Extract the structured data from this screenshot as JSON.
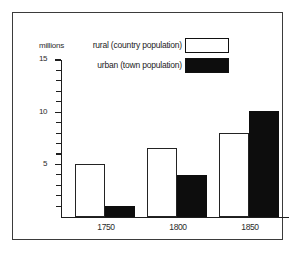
{
  "chart_data": {
    "type": "bar",
    "title": "",
    "xlabel": "",
    "ylabel": "millions",
    "categories": [
      "1750",
      "1800",
      "1850"
    ],
    "series": [
      {
        "name": "rural (country population)",
        "color": "#ffffff",
        "edge_color": "#232323",
        "values": [
          5.0,
          6.6,
          8.0
        ]
      },
      {
        "name": "urban (town population)",
        "color": "#0d0d0d",
        "edge_color": "#0d0d0d",
        "values": [
          1.0,
          4.0,
          10.1
        ]
      }
    ],
    "ylim": [
      0,
      15
    ],
    "ytick_labels": [
      "5",
      "10",
      "15"
    ],
    "ytick_values": [
      5,
      10,
      15
    ],
    "yticks_minor_step": 1,
    "grid": false,
    "legend_position": "top-right"
  },
  "axis": {
    "y_title": "millions",
    "ticks": [
      {
        "value": 15,
        "label": "15",
        "major": true
      },
      {
        "value": 14,
        "label": "",
        "major": false
      },
      {
        "value": 13,
        "label": "",
        "major": false
      },
      {
        "value": 12,
        "label": "",
        "major": false
      },
      {
        "value": 11,
        "label": "",
        "major": false
      },
      {
        "value": 10,
        "label": "10",
        "major": true
      },
      {
        "value": 9,
        "label": "",
        "major": false
      },
      {
        "value": 8,
        "label": "",
        "major": false
      },
      {
        "value": 7,
        "label": "",
        "major": false
      },
      {
        "value": 6,
        "label": "",
        "major": false
      },
      {
        "value": 5,
        "label": "5",
        "major": true
      },
      {
        "value": 4,
        "label": "",
        "major": false
      },
      {
        "value": 3,
        "label": "",
        "major": false
      },
      {
        "value": 2,
        "label": "",
        "major": false
      },
      {
        "value": 1,
        "label": "",
        "major": false
      }
    ]
  },
  "legend": {
    "items": [
      {
        "label": "rural (country population)",
        "swatch": "rural"
      },
      {
        "label": "urban (town population)",
        "swatch": "urban"
      }
    ]
  }
}
